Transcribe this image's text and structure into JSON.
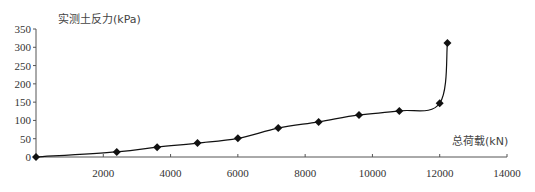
{
  "chart_data": {
    "type": "line",
    "title": "",
    "xlabel": "总荷载(kN)",
    "ylabel": "实测土反力(kPa)",
    "xlim": [
      0,
      14000
    ],
    "ylim": [
      0,
      350
    ],
    "x_ticks": [
      2000,
      4000,
      6000,
      8000,
      10000,
      12000,
      14000
    ],
    "y_ticks": [
      0,
      50,
      100,
      150,
      200,
      250,
      300,
      350
    ],
    "grid": false,
    "legend": null,
    "marker": "diamond",
    "series": [
      {
        "name": "实测土反力",
        "x": [
          0,
          2400,
          3600,
          4800,
          6000,
          7200,
          8400,
          9600,
          10800,
          12000,
          12230
        ],
        "y": [
          0,
          14,
          27,
          38,
          51,
          79,
          96,
          115,
          126,
          147,
          312
        ]
      }
    ]
  }
}
